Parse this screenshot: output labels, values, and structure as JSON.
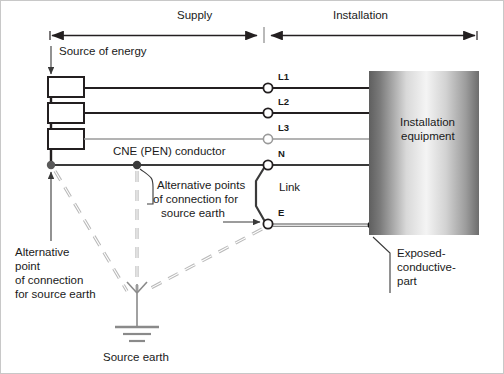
{
  "diagram": {
    "zones": {
      "supply_label": "Supply",
      "installation_label": "Installation"
    },
    "labels": {
      "source_of_energy": "Source of energy",
      "cne_conductor": "CNE (PEN) conductor",
      "link": "Link",
      "installation_equipment_line1": "Installation",
      "installation_equipment_line2": "equipment",
      "alternative_points_line1": "Alternative points",
      "alternative_points_line2": "of connection for",
      "alternative_points_line3": "source earth",
      "alternative_point_line1": "Alternative",
      "alternative_point_line2": "point",
      "alternative_point_line3": "of connection",
      "alternative_point_line4": "for source earth",
      "source_earth": "Source earth",
      "exposed_line1": "Exposed-",
      "exposed_line2": "conductive-",
      "exposed_line3": "part"
    },
    "conductors": [
      {
        "id": "L1",
        "label": "L1",
        "terminal_x": 267,
        "y": 87,
        "color": "#231f20",
        "weight": "heavy"
      },
      {
        "id": "L2",
        "label": "L2",
        "terminal_x": 267,
        "y": 112,
        "color": "#231f20",
        "weight": "heavy"
      },
      {
        "id": "L3",
        "label": "L3",
        "terminal_x": 267,
        "y": 138,
        "color": "#9a9a9a",
        "weight": "light"
      },
      {
        "id": "N",
        "label": "N",
        "terminal_x": 267,
        "y": 164,
        "color": "#3a3a3a",
        "weight": "heavy"
      },
      {
        "id": "E",
        "label": "E",
        "terminal_x": 267,
        "y": 223,
        "color": "#8a8a8a",
        "weight": "light"
      }
    ],
    "colors": {
      "line_dark": "#231f20",
      "line_mid": "#3a3a3a",
      "line_light": "#9a9a9a",
      "text": "#1a1a1a",
      "box_dark": "#6e6e6e",
      "box_light": "#f2f2f2",
      "dashed": "#b4b4b4",
      "background": "#ffffff",
      "border": "#c8c8c8"
    },
    "icons": {
      "earth": "earth-ground-icon",
      "terminal_open": "open-terminal-icon",
      "terminal_filled": "filled-node-icon",
      "arrow": "arrow-icon"
    }
  }
}
